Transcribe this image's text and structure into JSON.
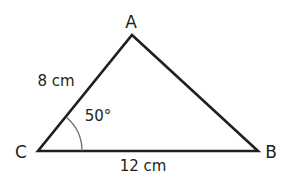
{
  "diagram": {
    "type": "triangle",
    "colors": {
      "stroke": "#231f20",
      "arc": "#6d6e71",
      "background": "#ffffff"
    },
    "vertices": {
      "A": {
        "label": "A",
        "x": 132,
        "y": 35
      },
      "B": {
        "label": "B",
        "x": 258,
        "y": 151
      },
      "C": {
        "label": "C",
        "x": 38,
        "y": 151
      }
    },
    "sides": {
      "CA": {
        "label": "8 cm"
      },
      "CB": {
        "label": "12 cm"
      }
    },
    "angles": {
      "C": {
        "label": "50°"
      }
    }
  }
}
